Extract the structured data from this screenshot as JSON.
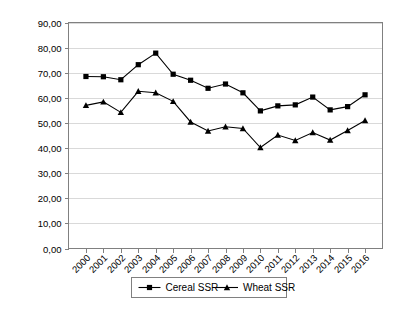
{
  "chart_data": {
    "type": "line",
    "title": "",
    "xlabel": "",
    "ylabel": "",
    "grid": "horizontal",
    "legend_position": "bottom",
    "ylim": [
      0,
      90
    ],
    "ytick_labels": [
      "0,00",
      "10,00",
      "20,00",
      "30,00",
      "40,00",
      "50,00",
      "60,00",
      "70,00",
      "80,00",
      "90,00"
    ],
    "ytick_values": [
      0,
      10,
      20,
      30,
      40,
      50,
      60,
      70,
      80,
      90
    ],
    "categories": [
      "2000",
      "2001",
      "2002",
      "2003",
      "2004",
      "2005",
      "2006",
      "2007",
      "2008",
      "2009",
      "2010",
      "2011",
      "2012",
      "2013",
      "2014",
      "2015",
      "2016"
    ],
    "series": [
      {
        "name": "Cereal SSR",
        "marker": "square",
        "color": "#000000",
        "values": [
          68.5,
          68.4,
          67.2,
          73.2,
          77.8,
          69.4,
          67.0,
          63.8,
          65.5,
          62.0,
          54.8,
          56.8,
          57.2,
          60.3,
          55.2,
          56.5,
          61.2
        ]
      },
      {
        "name": "Wheat SSR",
        "marker": "triangle",
        "color": "#000000",
        "values": [
          57.0,
          58.4,
          54.2,
          62.6,
          62.0,
          58.6,
          50.4,
          46.8,
          48.5,
          47.8,
          40.2,
          45.2,
          43.0,
          46.2,
          43.2,
          47.0,
          51.0
        ]
      }
    ]
  },
  "legend": {
    "items": [
      {
        "label": "Cereal SSR",
        "marker": "square"
      },
      {
        "label": "Wheat SSR",
        "marker": "triangle"
      }
    ]
  }
}
